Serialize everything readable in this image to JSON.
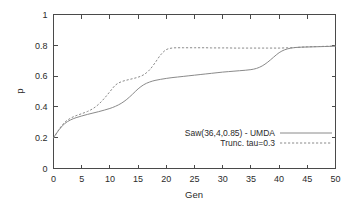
{
  "chart_data": {
    "type": "line",
    "title": "",
    "xlabel": "Gen",
    "ylabel": "p",
    "xlim": [
      0,
      50
    ],
    "ylim": [
      0,
      1
    ],
    "grid": false,
    "legend_position": "inside-lower-right",
    "xticks": [
      "0",
      "5",
      "10",
      "15",
      "20",
      "25",
      "30",
      "35",
      "40",
      "45",
      "50"
    ],
    "yticks": [
      "0",
      "0.2",
      "0.4",
      "0.6",
      "0.8",
      "1"
    ],
    "xtick_values": [
      0,
      5,
      10,
      15,
      20,
      25,
      30,
      35,
      40,
      45,
      50
    ],
    "ytick_values": [
      0,
      0.2,
      0.4,
      0.6,
      0.8,
      1
    ],
    "x": [
      0,
      1,
      2,
      3,
      4,
      5,
      6,
      7,
      8,
      9,
      10,
      11,
      12,
      13,
      14,
      15,
      16,
      17,
      18,
      19,
      20,
      21,
      22,
      23,
      24,
      25,
      26,
      27,
      28,
      29,
      30,
      31,
      32,
      33,
      34,
      35,
      36,
      37,
      38,
      39,
      40,
      41,
      42,
      43,
      44,
      45,
      46,
      47,
      48,
      49,
      50
    ],
    "series": [
      {
        "name": "Saw(36,4,0.85) - UMDA",
        "style": "solid",
        "color": "#8a8a8a",
        "values": [
          0.2,
          0.252,
          0.292,
          0.315,
          0.33,
          0.341,
          0.351,
          0.36,
          0.369,
          0.379,
          0.39,
          0.404,
          0.423,
          0.449,
          0.482,
          0.517,
          0.544,
          0.561,
          0.572,
          0.579,
          0.585,
          0.59,
          0.594,
          0.598,
          0.602,
          0.606,
          0.61,
          0.614,
          0.618,
          0.622,
          0.626,
          0.629,
          0.632,
          0.635,
          0.638,
          0.642,
          0.65,
          0.666,
          0.691,
          0.722,
          0.752,
          0.771,
          0.781,
          0.786,
          0.788,
          0.789,
          0.79,
          0.791,
          0.792,
          0.793,
          0.794
        ]
      },
      {
        "name": "Trunc. tau=0.3",
        "style": "dashed",
        "color": "#8a8a8a",
        "values": [
          0.196,
          0.255,
          0.3,
          0.326,
          0.343,
          0.356,
          0.37,
          0.389,
          0.417,
          0.455,
          0.499,
          0.542,
          0.563,
          0.574,
          0.583,
          0.593,
          0.609,
          0.639,
          0.686,
          0.738,
          0.772,
          0.782,
          0.784,
          0.784,
          0.784,
          0.784,
          0.784,
          0.784,
          0.783,
          0.783,
          0.783,
          0.783,
          0.782,
          0.782,
          0.782,
          0.782,
          0.782,
          0.782,
          0.782,
          0.782,
          0.782,
          0.783,
          0.784,
          0.786,
          0.788,
          0.79,
          0.791,
          0.792,
          0.793,
          0.794,
          0.796
        ]
      }
    ],
    "legend": [
      {
        "label": "Saw(36,4,0.85) - UMDA",
        "style": "solid"
      },
      {
        "label": "Trunc. tau=0.3",
        "style": "dashed"
      }
    ]
  },
  "colors": {
    "background": "#ffffff",
    "axis": "#4a4a4a",
    "text": "#2b2b2b",
    "series": "#8a8a8a"
  }
}
